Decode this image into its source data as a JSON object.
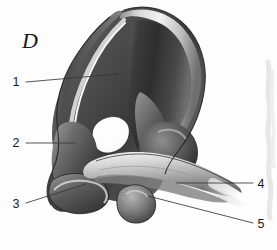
{
  "figure": {
    "panel_letter": "D",
    "background_color": "#fdfdfd",
    "ink_color": "#35383b",
    "label_color": "#1b1b1b"
  },
  "labels": [
    {
      "id": "1",
      "text": "1",
      "side": "left",
      "x": 16,
      "y": 86,
      "line": {
        "x1": 26,
        "y1": 82,
        "x2": 118,
        "y2": 74
      }
    },
    {
      "id": "2",
      "text": "2",
      "side": "left",
      "x": 16,
      "y": 147,
      "line": {
        "x1": 26,
        "y1": 143,
        "x2": 75,
        "y2": 143
      }
    },
    {
      "id": "3",
      "text": "3",
      "side": "left",
      "x": 16,
      "y": 208,
      "line": {
        "x1": 26,
        "y1": 203,
        "x2": 86,
        "y2": 184
      }
    },
    {
      "id": "4",
      "text": "4",
      "side": "right",
      "x": 258,
      "y": 188,
      "line": {
        "x1": 253,
        "y1": 183,
        "x2": 176,
        "y2": 183
      }
    },
    {
      "id": "5",
      "text": "5",
      "side": "right",
      "x": 258,
      "y": 228,
      "line": {
        "x1": 253,
        "y1": 223,
        "x2": 148,
        "y2": 196
      }
    }
  ],
  "structures": [
    {
      "name": "iliac-wing",
      "label_ref": "1"
    },
    {
      "name": "anterior-iliac-body",
      "label_ref": "2"
    },
    {
      "name": "inferior-margin",
      "label_ref": "3"
    },
    {
      "name": "pubic-ramus",
      "label_ref": "4"
    },
    {
      "name": "tubercle",
      "label_ref": "5"
    }
  ]
}
